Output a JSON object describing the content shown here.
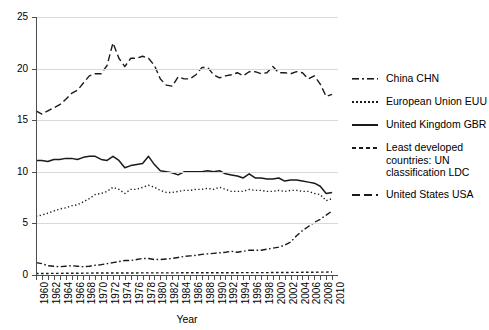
{
  "chart_data": {
    "type": "line",
    "title": "",
    "xlabel": "Year",
    "ylabel": "",
    "xlim": [
      1960,
      2011
    ],
    "ylim": [
      0,
      25
    ],
    "grid": true,
    "legend_position": "right",
    "yticks": [
      0,
      5,
      10,
      15,
      20,
      25
    ],
    "xticks": [
      1960,
      1962,
      1964,
      1966,
      1968,
      1970,
      1972,
      1974,
      1976,
      1978,
      1980,
      1982,
      1984,
      1986,
      1988,
      1990,
      1992,
      1994,
      1996,
      1998,
      2000,
      2002,
      2004,
      2006,
      2008,
      2010
    ],
    "x": [
      1960,
      1961,
      1962,
      1963,
      1964,
      1965,
      1966,
      1967,
      1968,
      1969,
      1970,
      1971,
      1972,
      1973,
      1974,
      1975,
      1976,
      1977,
      1978,
      1979,
      1980,
      1981,
      1982,
      1983,
      1984,
      1985,
      1986,
      1987,
      1988,
      1989,
      1990,
      1991,
      1992,
      1993,
      1994,
      1995,
      1996,
      1997,
      1998,
      1999,
      2000,
      2001,
      2002,
      2003,
      2004,
      2005,
      2006,
      2007,
      2008,
      2009,
      2010
    ],
    "series": [
      {
        "name": "China CHN",
        "key": "china",
        "style": "dashdot",
        "values": [
          1.2,
          1.1,
          0.9,
          0.85,
          0.8,
          0.85,
          0.9,
          0.85,
          0.8,
          0.85,
          0.95,
          1.0,
          1.1,
          1.2,
          1.3,
          1.4,
          1.4,
          1.5,
          1.6,
          1.6,
          1.5,
          1.5,
          1.55,
          1.6,
          1.7,
          1.8,
          1.85,
          1.9,
          2.0,
          2.05,
          2.1,
          2.15,
          2.2,
          2.3,
          2.2,
          2.3,
          2.4,
          2.4,
          2.4,
          2.5,
          2.6,
          2.7,
          2.9,
          3.2,
          3.8,
          4.3,
          4.7,
          5.1,
          5.4,
          5.8,
          6.2
        ]
      },
      {
        "name": "European Union EUU",
        "key": "eu",
        "style": "dotted",
        "values": [
          5.7,
          5.8,
          6.0,
          6.2,
          6.4,
          6.5,
          6.7,
          6.8,
          7.1,
          7.4,
          7.8,
          7.9,
          8.1,
          8.5,
          8.3,
          7.9,
          8.3,
          8.3,
          8.5,
          8.7,
          8.5,
          8.2,
          8.0,
          8.0,
          8.1,
          8.2,
          8.2,
          8.3,
          8.3,
          8.4,
          8.3,
          8.5,
          8.3,
          8.1,
          8.1,
          8.1,
          8.3,
          8.2,
          8.2,
          8.1,
          8.1,
          8.2,
          8.1,
          8.2,
          8.2,
          8.1,
          8.1,
          7.9,
          7.8,
          7.2,
          7.4
        ]
      },
      {
        "name": "United Kingdom GBR",
        "key": "uk",
        "style": "solid",
        "values": [
          11.1,
          11.1,
          11.0,
          11.2,
          11.2,
          11.3,
          11.3,
          11.2,
          11.4,
          11.5,
          11.5,
          11.2,
          11.1,
          11.5,
          11.1,
          10.4,
          10.6,
          10.7,
          10.8,
          11.5,
          10.7,
          10.1,
          10.0,
          9.9,
          9.7,
          10.0,
          10.0,
          10.0,
          10.0,
          10.1,
          10.0,
          10.1,
          9.8,
          9.7,
          9.6,
          9.4,
          9.8,
          9.4,
          9.4,
          9.3,
          9.3,
          9.4,
          9.1,
          9.2,
          9.2,
          9.1,
          9.0,
          8.9,
          8.6,
          7.9,
          8.0
        ]
      },
      {
        "name": "Least developed countries: UN classification LDC",
        "key": "ldc",
        "style": "shortdash",
        "values": [
          0.15,
          0.15,
          0.15,
          0.16,
          0.16,
          0.17,
          0.17,
          0.17,
          0.18,
          0.18,
          0.19,
          0.19,
          0.19,
          0.2,
          0.2,
          0.2,
          0.2,
          0.2,
          0.21,
          0.21,
          0.21,
          0.21,
          0.21,
          0.21,
          0.21,
          0.22,
          0.22,
          0.22,
          0.22,
          0.22,
          0.22,
          0.22,
          0.22,
          0.22,
          0.22,
          0.23,
          0.23,
          0.23,
          0.23,
          0.23,
          0.24,
          0.24,
          0.24,
          0.25,
          0.25,
          0.26,
          0.26,
          0.27,
          0.28,
          0.28,
          0.29
        ]
      },
      {
        "name": "United States USA",
        "key": "usa",
        "style": "longdash",
        "values": [
          15.9,
          15.6,
          15.9,
          16.2,
          16.5,
          17.0,
          17.6,
          17.9,
          18.6,
          19.3,
          19.5,
          19.5,
          20.3,
          22.5,
          21.0,
          20.2,
          21.0,
          21.0,
          21.2,
          21.0,
          20.3,
          19.0,
          18.4,
          18.3,
          19.2,
          19.0,
          19.0,
          19.4,
          20.1,
          20.1,
          19.4,
          19.1,
          19.3,
          19.4,
          19.6,
          19.3,
          19.7,
          19.7,
          19.5,
          19.6,
          20.2,
          19.6,
          19.6,
          19.5,
          19.7,
          19.6,
          19.0,
          19.3,
          18.5,
          17.3,
          17.5
        ]
      }
    ]
  },
  "legend": {
    "items": [
      {
        "label": "China CHN"
      },
      {
        "label": "European Union EUU"
      },
      {
        "label": "United Kingdom GBR"
      },
      {
        "label": "Least developed countries: UN classification LDC"
      },
      {
        "label": "United States USA"
      }
    ]
  },
  "axes": {
    "x_title": "Year"
  }
}
